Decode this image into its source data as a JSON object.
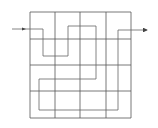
{
  "diagram": {
    "type": "grid-path",
    "grid": {
      "rows": 4,
      "cols": 4,
      "x_lines": [
        30,
        55,
        80,
        106,
        131
      ],
      "y_lines": [
        12,
        39,
        65,
        91,
        118
      ],
      "color": "#555555"
    },
    "path": {
      "points": [
        [
          12,
          29
        ],
        [
          43,
          29
        ],
        [
          43,
          56
        ],
        [
          68,
          56
        ],
        [
          68,
          26
        ],
        [
          96,
          26
        ],
        [
          96,
          79
        ],
        [
          39,
          79
        ],
        [
          39,
          110
        ],
        [
          118,
          110
        ],
        [
          118,
          30
        ],
        [
          147,
          30
        ]
      ],
      "color": "#666666",
      "start_arrow": true,
      "end_arrow": true
    }
  }
}
